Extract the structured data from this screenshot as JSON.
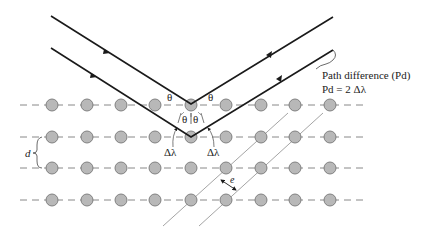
{
  "diagram": {
    "type": "bragg-diffraction",
    "labels": {
      "theta_left": "θ",
      "theta_right": "θ",
      "theta_pair": "θ|θ",
      "delta_lambda_left": "Δλ",
      "delta_lambda_right": "Δλ",
      "path_difference_title": "Path difference (Pd)",
      "path_difference_eq": "Pd = 2 Δλ",
      "d_label": "d",
      "e_label": "e"
    },
    "lattice": {
      "rows_y": [
        105,
        137,
        168,
        200
      ],
      "atoms_x": [
        52,
        87,
        121,
        155,
        191,
        226,
        261,
        295,
        330
      ],
      "line_start_x": 20,
      "line_end_x": 365,
      "atom_radius": 6,
      "atom_fill": "#b8b8b8",
      "atom_stroke": "#777777",
      "dash_color": "#888888"
    },
    "rays": {
      "color": "#1a1a1a",
      "upper": {
        "in_start": [
          51,
          16
        ],
        "reflect": [
          191,
          104
        ],
        "out_end": [
          333,
          17
        ]
      },
      "lower": {
        "in_start": [
          51,
          48
        ],
        "reflect": [
          191,
          137
        ],
        "out_end": [
          333,
          50
        ]
      }
    },
    "planes": {
      "color": "#999999",
      "lines": [
        {
          "from": [
            163,
            226
          ],
          "to": [
            288,
            113
          ]
        },
        {
          "from": [
            199,
            226
          ],
          "to": [
            323,
            113
          ]
        }
      ]
    }
  }
}
